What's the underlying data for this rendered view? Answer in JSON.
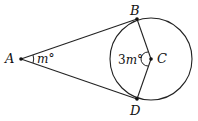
{
  "diagram": {
    "points": {
      "A": {
        "label": "A",
        "x": 21,
        "y": 59
      },
      "B": {
        "label": "B",
        "x": 137,
        "y": 19
      },
      "C": {
        "label": "C",
        "x": 151,
        "y": 59
      },
      "D": {
        "label": "D",
        "x": 137,
        "y": 99
      }
    },
    "circle": {
      "center": "C",
      "radius": 41
    },
    "angles": {
      "at_A": {
        "coef": "",
        "var": "m",
        "unit": "°"
      },
      "at_C": {
        "coef": "3",
        "var": "m",
        "unit": "°"
      }
    },
    "colors": {
      "stroke": "#222222",
      "text": "#111111"
    }
  }
}
